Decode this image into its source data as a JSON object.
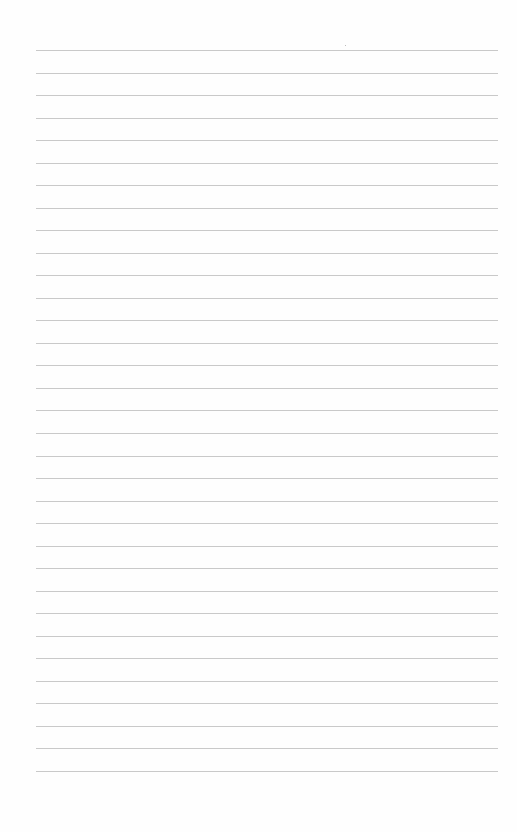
{
  "page": {
    "type": "lined-paper",
    "background_color": "#fefefe",
    "rule_color": "#c9c9c9",
    "rule_count": 33,
    "first_rule_y": 50,
    "rule_spacing": 22.53,
    "rule_left": 36,
    "rule_width": 462,
    "text": []
  }
}
